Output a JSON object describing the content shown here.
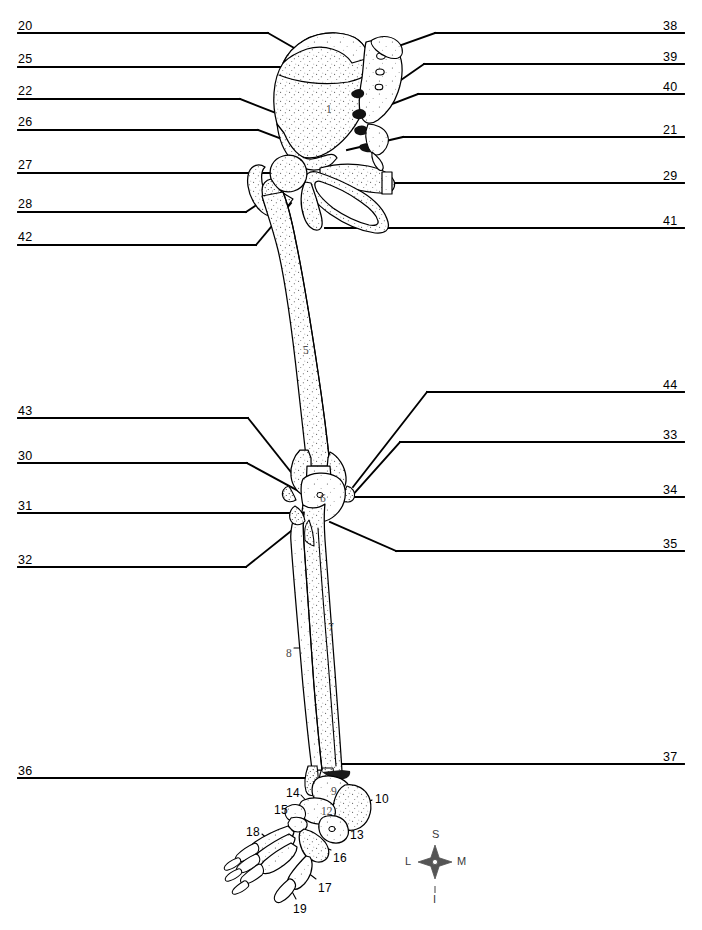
{
  "figure": {
    "view": "anterior",
    "ink_color": "#000000",
    "background_color": "#ffffff"
  },
  "left_labels": [
    {
      "number": "20",
      "x": 18,
      "y": 20,
      "rule_x1": 18,
      "rule_x2": 268,
      "rule_y": 33,
      "target_x": 296,
      "target_y": 49
    },
    {
      "number": "25",
      "x": 18,
      "y": 53,
      "rule_x1": 18,
      "rule_x2": 284,
      "rule_y": 67,
      "target_x": 352,
      "target_y": 82
    },
    {
      "number": "22",
      "x": 18,
      "y": 85,
      "rule_x1": 18,
      "rule_x2": 240,
      "rule_y": 99,
      "target_x": 312,
      "target_y": 127
    },
    {
      "number": "26",
      "x": 18,
      "y": 116,
      "rule_x1": 18,
      "rule_x2": 258,
      "rule_y": 130,
      "target_x": 303,
      "target_y": 147
    },
    {
      "number": "27",
      "x": 18,
      "y": 159,
      "rule_x1": 18,
      "rule_x2": 286,
      "rule_y": 173,
      "target_x": 300,
      "target_y": 173
    },
    {
      "number": "28",
      "x": 18,
      "y": 198,
      "rule_x1": 18,
      "rule_x2": 246,
      "rule_y": 212,
      "target_x": 273,
      "target_y": 194
    },
    {
      "number": "42",
      "x": 18,
      "y": 231,
      "rule_x1": 18,
      "rule_x2": 256,
      "rule_y": 245,
      "target_x": 291,
      "target_y": 203
    },
    {
      "number": "43",
      "x": 18,
      "y": 405,
      "rule_x1": 18,
      "rule_x2": 248,
      "rule_y": 418,
      "target_x": 298,
      "target_y": 481
    },
    {
      "number": "30",
      "x": 18,
      "y": 450,
      "rule_x1": 18,
      "rule_x2": 247,
      "rule_y": 463,
      "target_x": 302,
      "target_y": 493
    },
    {
      "number": "31",
      "x": 18,
      "y": 500,
      "rule_x1": 18,
      "rule_x2": 298,
      "rule_y": 513,
      "target_x": 298,
      "target_y": 513
    },
    {
      "number": "32",
      "x": 18,
      "y": 554,
      "rule_x1": 18,
      "rule_x2": 246,
      "rule_y": 567,
      "target_x": 296,
      "target_y": 527
    },
    {
      "number": "36",
      "x": 18,
      "y": 765,
      "rule_x1": 18,
      "rule_x2": 311,
      "rule_y": 778,
      "target_x": 311,
      "target_y": 778
    }
  ],
  "right_labels": [
    {
      "number": "38",
      "x": 663,
      "y": 20,
      "rule_x1": 435,
      "rule_x2": 684,
      "rule_y": 33,
      "target_x": 390,
      "target_y": 49
    },
    {
      "number": "39",
      "x": 663,
      "y": 51,
      "rule_x1": 424,
      "rule_x2": 684,
      "rule_y": 64,
      "target_x": 368,
      "target_y": 103
    },
    {
      "number": "40",
      "x": 663,
      "y": 81,
      "rule_x1": 418,
      "rule_x2": 684,
      "rule_y": 94,
      "target_x": 345,
      "target_y": 122
    },
    {
      "number": "21",
      "x": 663,
      "y": 124,
      "rule_x1": 403,
      "rule_x2": 684,
      "rule_y": 137,
      "target_x": 347,
      "target_y": 150
    },
    {
      "number": "29",
      "x": 663,
      "y": 170,
      "rule_x1": 386,
      "rule_x2": 684,
      "rule_y": 183,
      "target_x": 386,
      "target_y": 183
    },
    {
      "number": "41",
      "x": 663,
      "y": 215,
      "rule_x1": 325,
      "rule_x2": 684,
      "rule_y": 228,
      "target_x": 325,
      "target_y": 228
    },
    {
      "number": "44",
      "x": 663,
      "y": 379,
      "rule_x1": 427,
      "rule_x2": 684,
      "rule_y": 392,
      "target_x": 353,
      "target_y": 487
    },
    {
      "number": "33",
      "x": 663,
      "y": 429,
      "rule_x1": 400,
      "rule_x2": 684,
      "rule_y": 442,
      "target_x": 351,
      "target_y": 497
    },
    {
      "number": "34",
      "x": 663,
      "y": 484,
      "rule_x1": 354,
      "rule_x2": 684,
      "rule_y": 497,
      "target_x": 354,
      "target_y": 497
    },
    {
      "number": "35",
      "x": 663,
      "y": 538,
      "rule_x1": 396,
      "rule_x2": 684,
      "rule_y": 551,
      "target_x": 330,
      "target_y": 522
    },
    {
      "number": "37",
      "x": 663,
      "y": 751,
      "rule_x1": 340,
      "rule_x2": 684,
      "rule_y": 764,
      "target_x": 340,
      "target_y": 764
    }
  ],
  "foot_labels": [
    {
      "number": "14",
      "x": 286,
      "y": 787,
      "lead_x1": 301,
      "lead_y1": 795,
      "lead_x2": 311,
      "lead_y2": 806
    },
    {
      "number": "15",
      "x": 274,
      "y": 804,
      "lead_x1": 290,
      "lead_y1": 811,
      "lead_x2": 305,
      "lead_y2": 813
    },
    {
      "number": "10",
      "x": 375,
      "y": 793,
      "lead_x1": 372,
      "lead_y1": 800,
      "lead_x2": 356,
      "lead_y2": 808
    },
    {
      "number": "13",
      "x": 350,
      "y": 829,
      "lead_x1": 348,
      "lead_y1": 827,
      "lead_x2": 332,
      "lead_y2": 818
    },
    {
      "number": "18",
      "x": 246,
      "y": 826,
      "lead_x1": 262,
      "lead_y1": 834,
      "lead_x2": 274,
      "lead_y2": 845
    },
    {
      "number": "16",
      "x": 333,
      "y": 852,
      "lead_x1": 331,
      "lead_y1": 850,
      "lead_x2": 315,
      "lead_y2": 843
    },
    {
      "number": "17",
      "x": 318,
      "y": 882,
      "lead_x1": 316,
      "lead_y1": 879,
      "lead_x2": 303,
      "lead_y2": 869
    },
    {
      "number": "19",
      "x": 293,
      "y": 903,
      "lead_x1": 296,
      "lead_y1": 899,
      "lead_x2": 288,
      "lead_y2": 884
    }
  ],
  "bone_numbers": [
    {
      "number": "1",
      "x": 326,
      "y": 104
    },
    {
      "number": "5",
      "x": 303,
      "y": 345
    },
    {
      "number": "6",
      "x": 320,
      "y": 493
    },
    {
      "number": "7",
      "x": 328,
      "y": 622
    },
    {
      "number": "8",
      "x": 286,
      "y": 648,
      "lead_x1": 294,
      "lead_y1": 648,
      "lead_x2": 314,
      "lead_y2": 648
    },
    {
      "number": "9",
      "x": 331,
      "y": 786
    },
    {
      "number": "12",
      "x": 321,
      "y": 806
    }
  ],
  "compass": {
    "cx": 435,
    "cy": 862,
    "superior": "S",
    "inferior": "I",
    "lateral": "L",
    "medial": "M",
    "color": "#555555"
  }
}
